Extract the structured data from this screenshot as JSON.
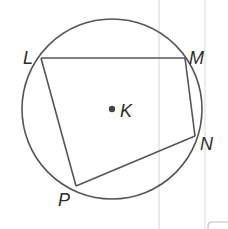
{
  "diagram": {
    "type": "inscribed-quadrilateral",
    "colors": {
      "stroke": "#555555",
      "text": "#2b2b2b",
      "guide_lines": "#d4d4d4",
      "background": "#ffffff"
    },
    "circle": {
      "center_label": "K",
      "cx": 112,
      "cy": 109,
      "r": 90
    },
    "points": [
      {
        "name": "L",
        "x": 41,
        "y": 58,
        "label_x": 23,
        "label_y": 64
      },
      {
        "name": "M",
        "x": 185,
        "y": 58,
        "label_x": 189,
        "label_y": 64
      },
      {
        "name": "N",
        "x": 195,
        "y": 136,
        "label_x": 200,
        "label_y": 150
      },
      {
        "name": "P",
        "x": 76,
        "y": 186,
        "label_x": 58,
        "label_y": 206
      }
    ],
    "segments": [
      [
        "L",
        "M"
      ],
      [
        "M",
        "N"
      ],
      [
        "N",
        "P"
      ],
      [
        "P",
        "L"
      ]
    ],
    "labels": {
      "L": "L",
      "M": "M",
      "N": "N",
      "P": "P",
      "K": "K"
    }
  }
}
